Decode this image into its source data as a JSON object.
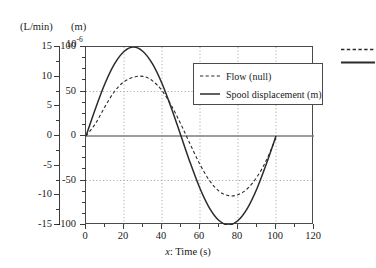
{
  "axes": {
    "left_unit": "(L/min)",
    "right_unit": "(m)",
    "exponent_base": "10",
    "exponent_power": "-6",
    "xtitle_prefix": "x",
    "xtitle_rest": ": Time (s)"
  },
  "legend": {
    "entries": [
      {
        "label": "Flow (null)",
        "style": "dashed"
      },
      {
        "label": "Spool displacement (m)",
        "style": "solid"
      }
    ]
  },
  "chart_data": {
    "type": "line",
    "title": "",
    "xlabel": "x: Time (s)",
    "ylabel": "",
    "xlim": [
      0,
      120
    ],
    "grid": true,
    "legend_position": "inside-top-right",
    "y_left": {
      "label": "(L/min)",
      "ticks": [
        15,
        10,
        5,
        0,
        -5,
        -10,
        -15
      ],
      "tick_labels": [
        "15",
        "10",
        "5",
        "0",
        "-5",
        "-10",
        "-15"
      ],
      "ylim": [
        -15,
        15
      ],
      "minor_step": 2.5
    },
    "y_right": {
      "label": "(m)",
      "multiplier": "10^-6",
      "ticks": [
        100,
        50,
        0,
        -50,
        -100
      ],
      "tick_labels": [
        "100",
        "50",
        "0",
        "-50",
        "-100"
      ],
      "ylim": [
        -100,
        100
      ],
      "minor_step": 12.5
    },
    "x_ticks": [
      0,
      20,
      40,
      60,
      80,
      100,
      120
    ],
    "x_tick_labels": [
      "0",
      "20",
      "40",
      "60",
      "80",
      "100",
      "120"
    ],
    "x_minor_step": 10,
    "gridlines_y": [
      50,
      -50
    ],
    "gridlines_x": [
      20,
      40,
      60,
      80,
      100
    ],
    "series": [
      {
        "name": "Spool displacement (m)",
        "style": "solid",
        "units": "1e-6 m",
        "peak_value": 100,
        "peak_x": 25,
        "trough_value": -100,
        "trough_x": 75,
        "zero_crossings": [
          0,
          50,
          100
        ],
        "x": [
          0,
          5,
          10,
          15,
          20,
          25,
          30,
          35,
          40,
          45,
          50,
          55,
          60,
          65,
          70,
          75,
          80,
          85,
          90,
          95,
          100
        ],
        "y": [
          0,
          31,
          59,
          81,
          95,
          100,
          95,
          81,
          59,
          31,
          0,
          -31,
          -59,
          -81,
          -95,
          -100,
          -95,
          -81,
          -59,
          -31,
          0
        ]
      },
      {
        "name": "Flow (null)",
        "style": "dashed",
        "units": "1e-6 (right scale)",
        "peak_value": 67,
        "peak_x": 27,
        "trough_value": -67,
        "trough_x": 77,
        "zero_crossings": [
          0,
          52,
          100
        ],
        "x": [
          0,
          5,
          10,
          15,
          20,
          25,
          30,
          35,
          40,
          45,
          50,
          55,
          60,
          65,
          70,
          75,
          80,
          85,
          90,
          95,
          100
        ],
        "y": [
          0,
          14,
          33,
          50,
          61,
          66,
          67,
          62,
          51,
          34,
          13,
          -10,
          -32,
          -50,
          -62,
          -67,
          -66,
          -59,
          -46,
          -27,
          -2
        ]
      }
    ]
  }
}
